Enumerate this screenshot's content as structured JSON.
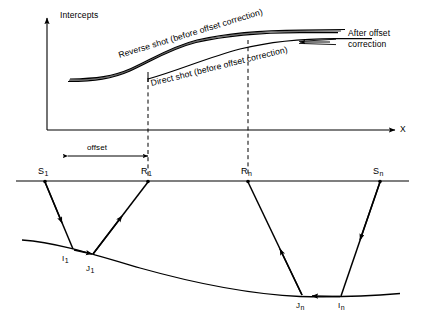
{
  "figure": {
    "kind": "seismic-refraction-diagram",
    "ink_color": "#000000"
  },
  "upper_plot": {
    "y_axis_label": "Intercepts",
    "x_axis_label": "X",
    "curve_labels": {
      "reverse": "Reverse shot (before offset correction)",
      "direct": "Direct shot (before offset correction)"
    },
    "annotation_right": {
      "line1": "After offset",
      "line2": "correction"
    },
    "offset_label": "offset"
  },
  "lower_plot": {
    "stations": [
      {
        "id": "S1",
        "base": "S",
        "sub": "1"
      },
      {
        "id": "R1",
        "base": "R",
        "sub": "1"
      },
      {
        "id": "Rn",
        "base": "R",
        "sub": "n"
      },
      {
        "id": "Sn",
        "base": "S",
        "sub": "n"
      }
    ],
    "refractor_nodes": [
      {
        "id": "I1",
        "base": "I",
        "sub": "1"
      },
      {
        "id": "J1",
        "base": "J",
        "sub": "1"
      },
      {
        "id": "Jn",
        "base": "J",
        "sub": "n"
      },
      {
        "id": "In",
        "base": "I",
        "sub": "n"
      }
    ]
  }
}
